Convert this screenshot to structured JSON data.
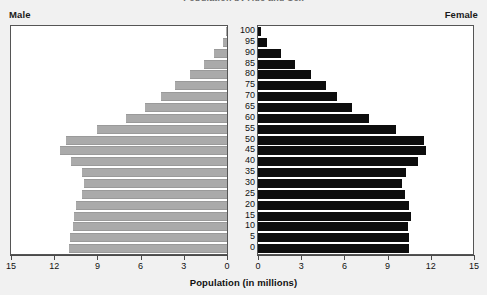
{
  "title": "Population by Age and Sex",
  "labels": {
    "male": "Male",
    "female": "Female",
    "axis_title": "Population (in millions)"
  },
  "axis": {
    "x_ticks_left": [
      "15",
      "12",
      "9",
      "6",
      "3",
      "0"
    ],
    "x_ticks_right": [
      "0",
      "3",
      "6",
      "9",
      "12",
      "15"
    ],
    "x_min": 0,
    "x_max": 15,
    "age_ticks": [
      "100",
      "95",
      "90",
      "85",
      "80",
      "75",
      "70",
      "65",
      "60",
      "55",
      "50",
      "45",
      "40",
      "35",
      "30",
      "25",
      "20",
      "15",
      "10",
      "5",
      "0"
    ]
  },
  "colors": {
    "male_bar": "#aaaaaa",
    "female_bar": "#0d0d0d",
    "panel_bg": "#ffffff",
    "page_bg": "#f1f1f1",
    "axis": "#4a4a4a"
  },
  "chart_data": {
    "type": "bar",
    "title": "Population by Age and Sex",
    "xlabel": "Population (in millions)",
    "ylabel": "Age",
    "xlim": [
      0,
      15
    ],
    "grid": false,
    "legend": [
      "Male",
      "Female"
    ],
    "legend_position": "top-outside",
    "orientation": "horizontal",
    "layout": "population-pyramid",
    "categories": [
      "100",
      "95",
      "90",
      "85",
      "80",
      "75",
      "70",
      "65",
      "60",
      "55",
      "50",
      "45",
      "40",
      "35",
      "30",
      "25",
      "20",
      "15",
      "10",
      "5",
      "0"
    ],
    "series": [
      {
        "name": "Male",
        "direction": "left",
        "values": [
          0.1,
          0.3,
          0.9,
          1.6,
          2.6,
          3.6,
          4.6,
          5.7,
          7.0,
          9.0,
          11.2,
          11.6,
          10.8,
          10.1,
          9.9,
          10.1,
          10.5,
          10.6,
          10.7,
          10.9,
          11.0
        ]
      },
      {
        "name": "Female",
        "direction": "right",
        "values": [
          0.2,
          0.6,
          1.6,
          2.6,
          3.7,
          4.7,
          5.5,
          6.5,
          7.7,
          9.6,
          11.5,
          11.7,
          11.1,
          10.3,
          10.0,
          10.2,
          10.5,
          10.6,
          10.4,
          10.5,
          10.5
        ]
      }
    ]
  }
}
